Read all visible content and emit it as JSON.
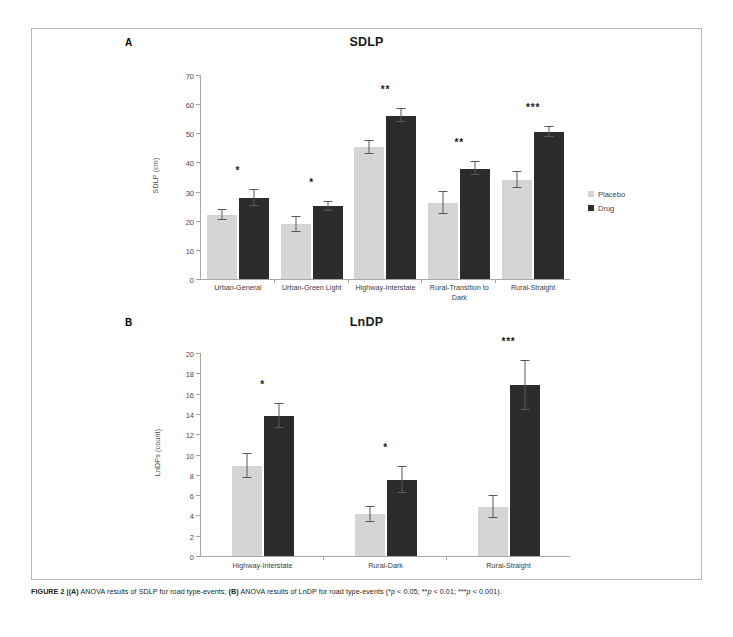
{
  "figure": {
    "caption_label": "FIGURE 2 |",
    "caption_a_tag": "(A)",
    "caption_a_text": " ANOVA results of SDLP for road type-events; ",
    "caption_b_tag": "(B)",
    "caption_b_text": " ANOVA results of LnDP for road type-events (*",
    "caption_p1": "p",
    "caption_mid1": " < 0.05; **",
    "caption_p2": "p",
    "caption_mid2": " < 0.01; ***",
    "caption_p3": "p",
    "caption_end": " < 0.001)."
  },
  "colors": {
    "placebo": "#d5d5d5",
    "drug": "#2c2c2c",
    "error_bar": "#58585a",
    "axis": "#a6a6a6",
    "frame": "#b9b9b9"
  },
  "panel_a": {
    "letter": "A",
    "title": "SDLP"
  },
  "panel_b": {
    "letter": "B",
    "title": "LnDP"
  },
  "legend": {
    "placebo_label": "Placebo",
    "drug_label": "Drug"
  },
  "chart_data": [
    {
      "type": "bar",
      "panel": "A",
      "title": "SDLP",
      "xlabel": "",
      "ylabel": "SDLP (cm)",
      "ylim": [
        0,
        70
      ],
      "yticks": [
        0,
        10,
        20,
        30,
        40,
        50,
        60,
        70
      ],
      "grid": false,
      "legend_position": "right",
      "categories": [
        "Urban-General",
        "Urban-Green Light",
        "Highway-Interstate",
        "Rural-Transition to Dark",
        "Rural-Straight"
      ],
      "series": [
        {
          "name": "Placebo",
          "color": "#d5d5d5",
          "values": [
            22.0,
            18.8,
            45.2,
            26.0,
            34.0
          ],
          "errors": [
            1.6,
            2.6,
            2.2,
            3.8,
            2.8
          ]
        },
        {
          "name": "Drug",
          "color": "#2c2c2c",
          "values": [
            27.8,
            24.9,
            56.0,
            37.9,
            50.5
          ],
          "errors": [
            2.6,
            1.6,
            2.2,
            2.2,
            1.8
          ]
        }
      ],
      "significance": [
        "*",
        "*",
        "**",
        "**",
        "***"
      ]
    },
    {
      "type": "bar",
      "panel": "B",
      "title": "LnDP",
      "xlabel": "",
      "ylabel": "LnDPs (count)",
      "ylim": [
        0,
        20
      ],
      "yticks": [
        0,
        2,
        4,
        6,
        8,
        10,
        12,
        14,
        16,
        18,
        20
      ],
      "grid": false,
      "legend_position": "right",
      "categories": [
        "Highway-Interstate",
        "Rural-Dark",
        "Rural-Straight"
      ],
      "series": [
        {
          "name": "Placebo",
          "color": "#d5d5d5",
          "values": [
            8.9,
            4.1,
            4.8
          ],
          "errors": [
            1.2,
            0.7,
            1.1
          ]
        },
        {
          "name": "Drug",
          "color": "#2c2c2c",
          "values": [
            13.8,
            7.5,
            16.8
          ],
          "errors": [
            1.2,
            1.3,
            2.4
          ]
        }
      ],
      "significance": [
        "*",
        "*",
        "***"
      ]
    }
  ]
}
